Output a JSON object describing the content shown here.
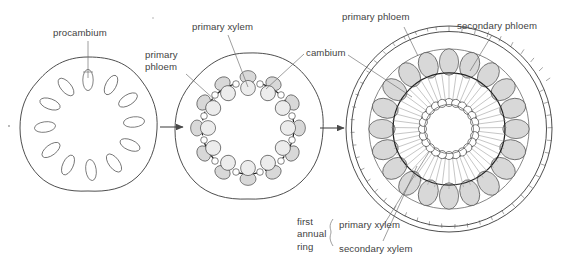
{
  "figure": {
    "kind": "botanical-diagram",
    "stage_count": 3,
    "colors": {
      "background": "#ffffff",
      "ink": "#3f3f3f",
      "outline": "#4e4e4e",
      "shading": "#d8d8d8",
      "leader": "#6b6b6b"
    }
  },
  "labels": {
    "procambium": "procambium",
    "primary_phloem_mid_line1": "primary",
    "primary_phloem_mid_line2": "phloem",
    "primary_xylem_mid": "primary xylem",
    "cambium": "cambium",
    "primary_phloem_right": "primary phloem",
    "secondary_phloem_right": "secondary phloem",
    "brace_group_line1": "first",
    "brace_group_line2": "annual",
    "brace_group_line3": "ring",
    "brace_item_1": "primary xylem",
    "brace_item_2": "secondary xylem"
  },
  "stages": [
    {
      "index": 1,
      "name": "procambium-stage",
      "outline_shape": "rounded-square",
      "center": {
        "x": 88,
        "y": 127
      },
      "strand_count": 12,
      "strand_style": "open-oval",
      "labels": [
        "procambium"
      ]
    },
    {
      "index": 2,
      "name": "primary-vascular-stage",
      "outline_shape": "rounded-square",
      "center": {
        "x": 248,
        "y": 128
      },
      "bundle_count": 12,
      "interfascicular_count": 12,
      "strand_style": "shaded-bundle-with-cambium-band",
      "labels": [
        "primary phloem",
        "primary xylem",
        "cambium"
      ]
    },
    {
      "index": 3,
      "name": "secondary-growth-stage",
      "outline_shape": "circle",
      "center": {
        "x": 449,
        "y": 129
      },
      "ring_count": 5,
      "phloem_lobe_count": 20,
      "xylem_ray_count": 48,
      "periderm_style": "double-walled-hatched-band",
      "labels": [
        "primary phloem",
        "secondary phloem",
        "cambium",
        "primary xylem",
        "secondary xylem"
      ]
    }
  ],
  "arrows": [
    {
      "name": "arrow-stage1-to-stage2",
      "from_stage": 1,
      "to_stage": 2,
      "direction": "right"
    },
    {
      "name": "arrow-stage2-to-stage3",
      "from_stage": 2,
      "to_stage": 3,
      "direction": "right"
    }
  ]
}
